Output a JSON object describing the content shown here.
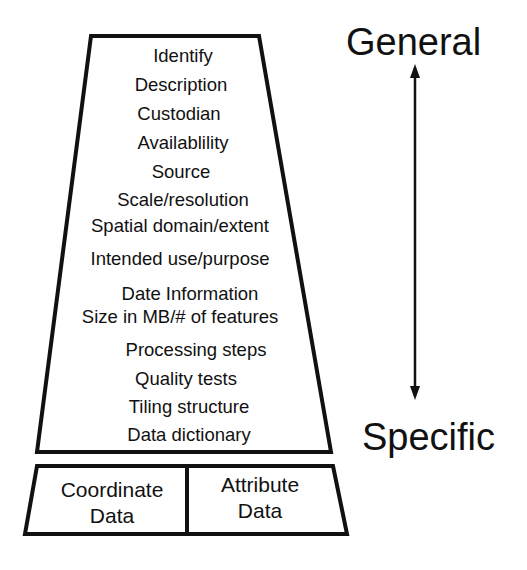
{
  "diagram": {
    "type": "metadata-hierarchy-pyramid",
    "upper_box": {
      "items": [
        "Identify",
        "Description",
        "Custodian",
        "Availablility",
        "Source",
        "Scale/resolution",
        "Spatial domain/extent",
        "Intended use/purpose",
        "Date Information",
        "Size in MB/# of features",
        "Processing steps",
        "Quality tests",
        "Tiling structure",
        "Data dictionary"
      ]
    },
    "lower_box": {
      "left": {
        "line1": "Coordinate",
        "line2": "Data"
      },
      "right": {
        "line1": "Attribute",
        "line2": "Data"
      }
    },
    "scale": {
      "top_label": "General",
      "bottom_label": "Specific",
      "arrow": "double-headed vertical"
    },
    "colors": {
      "stroke": "#111111",
      "background": "#ffffff",
      "text": "#111111"
    }
  }
}
